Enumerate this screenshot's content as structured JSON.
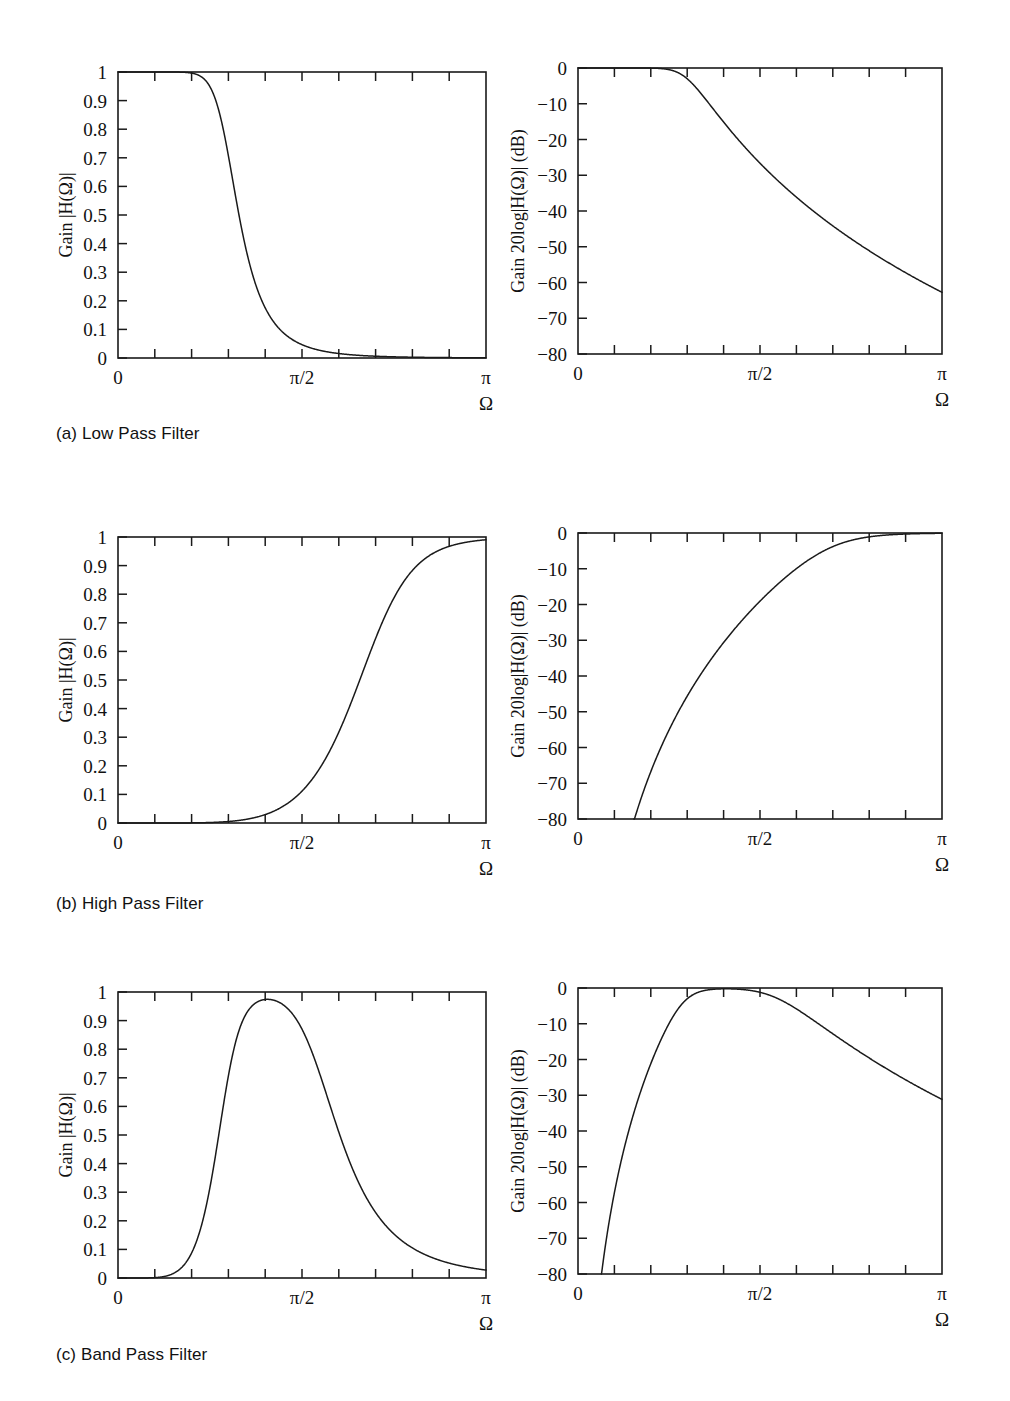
{
  "figure": {
    "background": "#ffffff",
    "ink": "#1a1a1a",
    "rows": [
      {
        "id": "low-pass",
        "caption": "(a) Low Pass Filter",
        "panels": [
          "lp-linear",
          "lp-db"
        ]
      },
      {
        "id": "high-pass",
        "caption": "(b) High Pass Filter",
        "panels": [
          "hp-linear",
          "hp-db"
        ]
      },
      {
        "id": "band-pass",
        "caption": "(c) Band Pass Filter",
        "panels": [
          "bp-linear",
          "bp-db"
        ]
      }
    ]
  },
  "labels": {
    "y_linear": "Gain |H(Ω)|",
    "y_db": "Gain 20log|H(Ω)| (dB)",
    "x_axis": "Ω",
    "x_ticks": [
      "0",
      "π/2",
      "π"
    ],
    "y_ticks_linear": [
      "1",
      "0.9",
      "0.8",
      "0.7",
      "0.6",
      "0.5",
      "0.4",
      "0.3",
      "0.2",
      "0.1",
      "0"
    ],
    "y_ticks_db": [
      "0",
      "−10",
      "−20",
      "−30",
      "−40",
      "−50",
      "−60",
      "−70",
      "−80"
    ]
  },
  "chart_data": [
    {
      "type": "line",
      "id": "lp-linear",
      "title": "",
      "xlabel": "Ω",
      "ylabel": "Gain |H(Ω)|",
      "xlim": [
        0,
        3.141592653589793
      ],
      "ylim": [
        0,
        1
      ],
      "xtick_values": [
        0,
        1.5707963267948966,
        3.141592653589793
      ],
      "xtick_labels": [
        "0",
        "π/2",
        "π"
      ],
      "ytick_values": [
        0,
        0.1,
        0.2,
        0.3,
        0.4,
        0.5,
        0.6,
        0.7,
        0.8,
        0.9,
        1
      ],
      "ytick_labels": [
        "0",
        "0.1",
        "0.2",
        "0.3",
        "0.4",
        "0.5",
        "0.6",
        "0.7",
        "0.8",
        "0.9",
        "1"
      ],
      "minor_xticks": 10,
      "grid": false,
      "legend": null,
      "filter": {
        "kind": "lowpass",
        "order": 6,
        "cutoff_frac_of_pi": 0.3
      },
      "x_frac_of_pi": [
        0.0,
        0.05,
        0.1,
        0.15,
        0.2,
        0.25,
        0.3,
        0.35,
        0.4,
        0.45,
        0.5,
        0.55,
        0.6,
        0.65,
        0.7,
        0.75,
        0.8,
        0.85,
        0.9,
        0.95,
        1.0
      ],
      "values": [
        1.0,
        1.0,
        1.0,
        0.999,
        0.993,
        0.961,
        0.707,
        0.296,
        0.105,
        0.042,
        0.019,
        0.009,
        0.005,
        0.003,
        0.002,
        0.001,
        0.001,
        0.0,
        0.0,
        0.0,
        0.0
      ]
    },
    {
      "type": "line",
      "id": "lp-db",
      "title": "",
      "xlabel": "Ω",
      "ylabel": "Gain 20log|H(Ω)| (dB)",
      "xlim": [
        0,
        3.141592653589793
      ],
      "ylim": [
        -80,
        0
      ],
      "xtick_values": [
        0,
        1.5707963267948966,
        3.141592653589793
      ],
      "xtick_labels": [
        "0",
        "π/2",
        "π"
      ],
      "ytick_values": [
        -80,
        -70,
        -60,
        -50,
        -40,
        -30,
        -20,
        -10,
        0
      ],
      "ytick_labels": [
        "−80",
        "−70",
        "−60",
        "−50",
        "−40",
        "−30",
        "−20",
        "−10",
        "0"
      ],
      "minor_xticks": 10,
      "grid": false,
      "legend": null,
      "filter": {
        "kind": "lowpass",
        "order": 6,
        "cutoff_frac_of_pi": 0.3
      },
      "x_frac_of_pi": [
        0.0,
        0.05,
        0.1,
        0.15,
        0.2,
        0.25,
        0.3,
        0.35,
        0.4,
        0.45,
        0.5,
        0.55,
        0.6,
        0.65,
        0.7,
        0.75,
        0.8,
        0.85,
        0.9,
        0.95,
        1.0
      ],
      "values": [
        0.0,
        0.0,
        -0.01,
        -0.1,
        -0.6,
        -3.0,
        -3.0,
        -10.6,
        -19.6,
        -27.5,
        -34.5,
        -41.0,
        -47.0,
        -52.6,
        -58.0,
        -63.2,
        -68.3,
        -73.5,
        -79.0,
        -85.0,
        -95.0
      ]
    },
    {
      "type": "line",
      "id": "hp-linear",
      "title": "",
      "xlabel": "Ω",
      "ylabel": "Gain |H(Ω)|",
      "xlim": [
        0,
        3.141592653589793
      ],
      "ylim": [
        0,
        1
      ],
      "xtick_values": [
        0,
        1.5707963267948966,
        3.141592653589793
      ],
      "xtick_labels": [
        "0",
        "π/2",
        "π"
      ],
      "ytick_values": [
        0,
        0.1,
        0.2,
        0.3,
        0.4,
        0.5,
        0.6,
        0.7,
        0.8,
        0.9,
        1
      ],
      "ytick_labels": [
        "0",
        "0.1",
        "0.2",
        "0.3",
        "0.4",
        "0.5",
        "0.6",
        "0.7",
        "0.8",
        "0.9",
        "1"
      ],
      "minor_xticks": 10,
      "grid": false,
      "legend": null,
      "filter": {
        "kind": "highpass",
        "order": 6,
        "cutoff_frac_of_pi": 0.72
      },
      "x_frac_of_pi": [
        0.0,
        0.05,
        0.1,
        0.15,
        0.2,
        0.25,
        0.3,
        0.35,
        0.4,
        0.45,
        0.5,
        0.55,
        0.6,
        0.65,
        0.7,
        0.75,
        0.8,
        0.85,
        0.9,
        0.95,
        1.0
      ],
      "values": [
        0.0,
        0.0,
        0.001,
        0.002,
        0.005,
        0.01,
        0.018,
        0.03,
        0.049,
        0.077,
        0.12,
        0.19,
        0.3,
        0.47,
        0.68,
        0.87,
        0.96,
        0.992,
        0.999,
        1.0,
        1.0
      ]
    },
    {
      "type": "line",
      "id": "hp-db",
      "title": "",
      "xlabel": "Ω",
      "ylabel": "Gain 20log|H(Ω)| (dB)",
      "xlim": [
        0,
        3.141592653589793
      ],
      "ylim": [
        -80,
        0
      ],
      "xtick_values": [
        0,
        1.5707963267948966,
        3.141592653589793
      ],
      "xtick_labels": [
        "0",
        "π/2",
        "π"
      ],
      "ytick_values": [
        -80,
        -70,
        -60,
        -50,
        -40,
        -30,
        -20,
        -10,
        0
      ],
      "ytick_labels": [
        "−80",
        "−70",
        "−60",
        "−50",
        "−40",
        "−30",
        "−20",
        "−10",
        "0"
      ],
      "minor_xticks": 10,
      "grid": false,
      "legend": null,
      "filter": {
        "kind": "highpass",
        "order": 6,
        "cutoff_frac_of_pi": 0.72
      },
      "x_frac_of_pi": [
        0.0,
        0.05,
        0.1,
        0.15,
        0.2,
        0.25,
        0.3,
        0.35,
        0.4,
        0.45,
        0.5,
        0.55,
        0.6,
        0.65,
        0.7,
        0.75,
        0.8,
        0.85,
        0.9,
        0.95,
        1.0
      ],
      "values": [
        -120.0,
        -95.0,
        -80.0,
        -70.0,
        -61.0,
        -53.0,
        -46.5,
        -40.8,
        -35.5,
        -30.7,
        -26.2,
        -22.0,
        -18.0,
        -14.2,
        -10.6,
        -7.3,
        -4.4,
        -2.2,
        -0.8,
        -0.2,
        0.0
      ]
    },
    {
      "type": "line",
      "id": "bp-linear",
      "title": "",
      "xlabel": "Ω",
      "ylabel": "Gain |H(Ω)|",
      "xlim": [
        0,
        3.141592653589793
      ],
      "ylim": [
        0,
        1
      ],
      "xtick_values": [
        0,
        1.5707963267948966,
        3.141592653589793
      ],
      "xtick_labels": [
        "0",
        "π/2",
        "π"
      ],
      "ytick_values": [
        0,
        0.1,
        0.2,
        0.3,
        0.4,
        0.5,
        0.6,
        0.7,
        0.8,
        0.9,
        1
      ],
      "ytick_labels": [
        "0",
        "0.1",
        "0.2",
        "0.3",
        "0.4",
        "0.5",
        "0.6",
        "0.7",
        "0.8",
        "0.9",
        "1"
      ],
      "minor_xticks": 10,
      "grid": false,
      "legend": null,
      "filter": {
        "kind": "bandpass",
        "order": 6,
        "band_frac_of_pi": [
          0.3,
          0.55
        ]
      },
      "x_frac_of_pi": [
        0.0,
        0.05,
        0.1,
        0.15,
        0.2,
        0.25,
        0.3,
        0.35,
        0.4,
        0.45,
        0.5,
        0.55,
        0.6,
        0.65,
        0.7,
        0.75,
        0.8,
        0.85,
        0.9,
        0.95,
        1.0
      ],
      "values": [
        0.0,
        0.002,
        0.008,
        0.024,
        0.07,
        0.23,
        0.707,
        0.985,
        1.0,
        1.0,
        1.0,
        0.707,
        0.2,
        0.07,
        0.03,
        0.015,
        0.008,
        0.004,
        0.002,
        0.001,
        0.0
      ]
    },
    {
      "type": "line",
      "id": "bp-db",
      "title": "",
      "xlabel": "Ω",
      "ylabel": "Gain 20log|H(Ω)| (dB)",
      "xlim": [
        0,
        3.141592653589793
      ],
      "ylim": [
        -80,
        0
      ],
      "xtick_values": [
        0,
        1.5707963267948966,
        3.141592653589793
      ],
      "xtick_labels": [
        "0",
        "π/2",
        "π"
      ],
      "ytick_values": [
        -80,
        -70,
        -60,
        -50,
        -40,
        -30,
        -20,
        -10,
        0
      ],
      "ytick_labels": [
        "−80",
        "−70",
        "−60",
        "−50",
        "−40",
        "−30",
        "−20",
        "−10",
        "0"
      ],
      "minor_xticks": 10,
      "grid": false,
      "legend": null,
      "filter": {
        "kind": "bandpass",
        "order": 6,
        "band_frac_of_pi": [
          0.3,
          0.55
        ]
      },
      "x_frac_of_pi": [
        0.0,
        0.05,
        0.1,
        0.15,
        0.2,
        0.25,
        0.3,
        0.35,
        0.4,
        0.45,
        0.5,
        0.55,
        0.6,
        0.65,
        0.7,
        0.75,
        0.8,
        0.85,
        0.9,
        0.95,
        1.0
      ],
      "values": [
        -120.0,
        -78.0,
        -62.0,
        -48.0,
        -35.0,
        -22.0,
        -3.0,
        -0.3,
        0.0,
        0.0,
        0.0,
        -3.0,
        -14.0,
        -25.0,
        -34.0,
        -42.0,
        -50.0,
        -58.0,
        -66.0,
        -76.0,
        -120.0
      ]
    }
  ]
}
